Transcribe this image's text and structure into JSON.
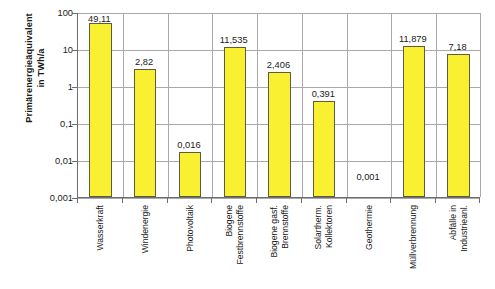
{
  "chart_data": {
    "type": "bar",
    "title": "",
    "xlabel": "",
    "ylabel": "Primärenergieäquivalent in TWh/a",
    "ylabel_lines": [
      "Primärenergieäquivalent",
      "in TWh/a"
    ],
    "yscale": "log",
    "ylim": [
      0.001,
      100
    ],
    "ytick_labels": [
      "100",
      "10",
      "1",
      "0,1",
      "0,01",
      "0,001"
    ],
    "ytick_values": [
      100,
      10,
      1,
      0.1,
      0.01,
      0.001
    ],
    "grid": true,
    "legend": false,
    "bar_color": "#FAF032",
    "bar_edge_color": "#5C5C42",
    "grid_color": "#A9A9A9",
    "axis_color": "#6E6E6E",
    "categories": [
      "Wasserkraft",
      "Windenergie",
      "Photovoltaik",
      "Biogene Festbrennstoffe",
      "Biogene gasf. Brennstoffe",
      "Solartherm. Kollektoren",
      "Geothermie",
      "Müllverbrennung",
      "Abfälle in Industrieanl."
    ],
    "category_label_lines": [
      [
        "Wasserkraft"
      ],
      [
        "Windenergie"
      ],
      [
        "Photovoltaik"
      ],
      [
        "Biogene",
        "Festbrennstoffe"
      ],
      [
        "Biogene gasf.",
        "Brennstoffe"
      ],
      [
        "Solartherm.",
        "Kollektoren"
      ],
      [
        "Geothermie"
      ],
      [
        "Müllverbrennung"
      ],
      [
        "Abfälle in",
        "Industrieanl."
      ]
    ],
    "values": [
      49.11,
      2.82,
      0.016,
      11.535,
      2.406,
      0.391,
      0.001,
      11.879,
      7.18
    ],
    "value_labels": [
      "49,11",
      "2,82",
      "0,016",
      "11,535",
      "2,406",
      "0,391",
      "0,001",
      "11,879",
      "7,18"
    ]
  }
}
